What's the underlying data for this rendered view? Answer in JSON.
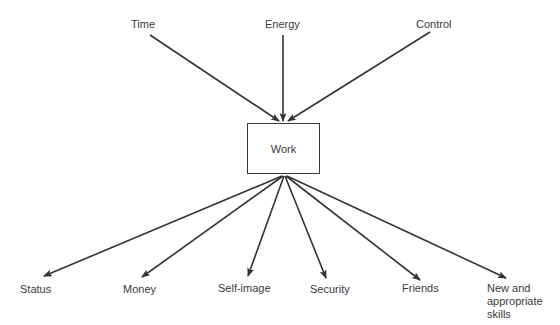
{
  "diagram": {
    "type": "flow",
    "center": {
      "label": "Work"
    },
    "inputs": [
      {
        "label": "Time"
      },
      {
        "label": "Energy"
      },
      {
        "label": "Control"
      }
    ],
    "outputs": [
      {
        "label": "Status"
      },
      {
        "label": "Money"
      },
      {
        "label": "Self-image"
      },
      {
        "label": "Security"
      },
      {
        "label": "Friends"
      },
      {
        "label": "New and\nappropriate\nskills"
      }
    ],
    "colors": {
      "line": "#333333",
      "text": "#3a3a3a",
      "background": "#ffffff"
    }
  }
}
